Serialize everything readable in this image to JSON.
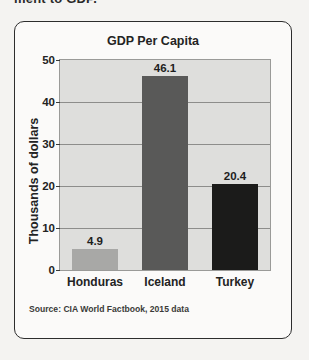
{
  "page": {
    "clipped_header_text": "ment to GDP."
  },
  "figure": {
    "source_note": "Source: CIA World Factbook, 2015 data"
  },
  "colors": {
    "card_border": "#2d2d2d",
    "card_background": "#fbfaf9",
    "page_background": "#f4f3f1",
    "plot_background": "#dededc",
    "gridline": "#8d8d8b",
    "text": "#232323",
    "bar_honduras": "#a8a8a6",
    "bar_iceland": "#595958",
    "bar_turkey": "#1b1b1a"
  },
  "chart_data": {
    "type": "bar",
    "title": "GDP Per Capita",
    "xlabel": "",
    "ylabel": "Thousands of dollars",
    "categories": [
      "Honduras",
      "Iceland",
      "Turkey"
    ],
    "values": [
      4.9,
      46.1,
      20.4
    ],
    "value_labels": [
      "4.9",
      "46.1",
      "20.4"
    ],
    "bar_colors": [
      "#a8a8a6",
      "#595958",
      "#1b1b1a"
    ],
    "ylim": [
      0,
      50
    ],
    "yticks": [
      0,
      10,
      20,
      30,
      40,
      50
    ],
    "ytick_labels": [
      "0",
      "10",
      "20",
      "30",
      "40",
      "50"
    ],
    "grid": true,
    "gridlines_at": [
      10,
      20,
      30,
      40
    ],
    "legend": null,
    "legend_position": "none",
    "source": "Source: CIA World Factbook, 2015 data"
  }
}
